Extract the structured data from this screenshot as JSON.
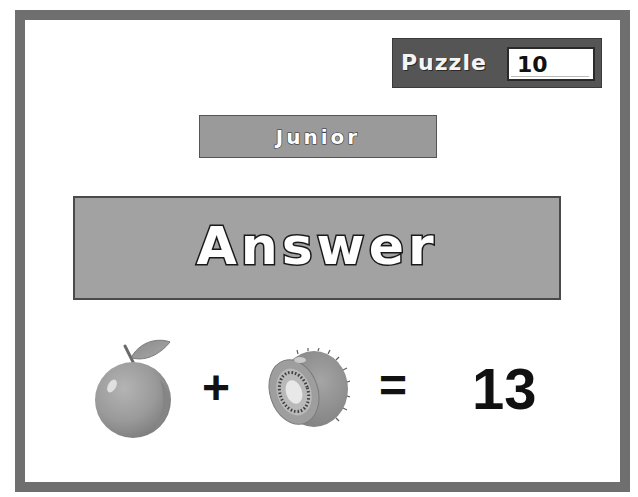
{
  "puzzle": {
    "label": "Puzzle",
    "number": "10"
  },
  "level": {
    "label": "Junior"
  },
  "answer": {
    "label": "Answer"
  },
  "equation": {
    "term1": {
      "icon": "orange-icon",
      "name": "orange"
    },
    "operator1": "+",
    "term2": {
      "icon": "kiwi-icon",
      "name": "kiwi"
    },
    "operator2": "=",
    "result": "13"
  },
  "colors": {
    "frame": "#6f6f6f",
    "puzzle_box": "#555555",
    "level_box": "#9a9a9a",
    "answer_box": "#a2a2a2",
    "text_dark": "#111111",
    "text_light": "#ffffff"
  }
}
